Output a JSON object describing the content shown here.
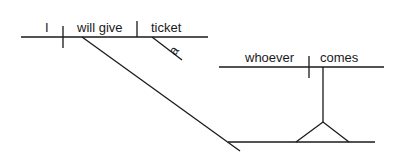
{
  "diagram": {
    "type": "sentence-diagram",
    "main_clause": {
      "subject": "I",
      "verb": "will give",
      "direct_object": "ticket",
      "object_modifier": "a"
    },
    "subordinate_clause": {
      "subject": "whoever",
      "verb": "comes",
      "role": "indirect object (noun clause on pedestal)"
    },
    "colors": {
      "line": "#1a1a1a",
      "background": "#ffffff"
    }
  }
}
